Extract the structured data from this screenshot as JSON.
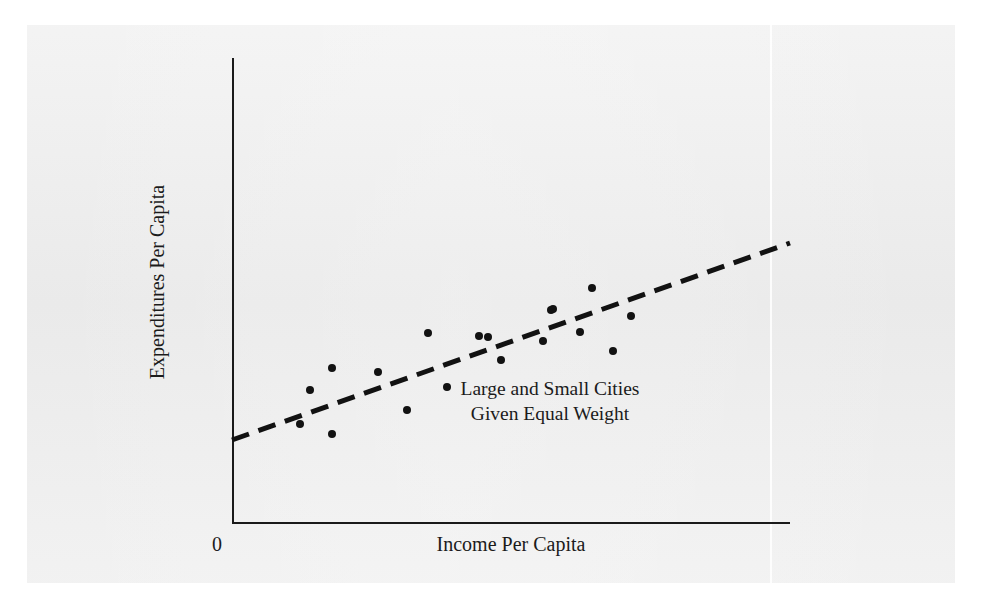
{
  "figure": {
    "paper_color": "#ebebeb",
    "ink_color": "#121212",
    "annotation_line1": "Large and Small Cities",
    "annotation_line2": "Given Equal Weight",
    "origin_label": "0"
  },
  "chart_data": {
    "type": "scatter",
    "title": "",
    "subtitle": "",
    "xlabel": "Income Per Capita",
    "ylabel": "Expenditures Per Capita",
    "xtick_labels": [
      "0"
    ],
    "ytick_labels": [],
    "grid": false,
    "legend": null,
    "annotations": [
      {
        "text": "Large and Small Cities Given Equal Weight",
        "lines": [
          "Large and Small Cities",
          "Given Equal Weight"
        ],
        "x_px": 550,
        "y_px": 400
      }
    ],
    "axis_pixel_frame": {
      "x_axis_x_start_px": 232,
      "x_axis_x_end_px": 790,
      "y_axis_y_top_px": 58,
      "y_axis_y_bottom_px": 523
    },
    "points_px": [
      {
        "x": 300,
        "y": 424
      },
      {
        "x": 310,
        "y": 390
      },
      {
        "x": 332,
        "y": 368
      },
      {
        "x": 332,
        "y": 434
      },
      {
        "x": 378,
        "y": 372
      },
      {
        "x": 407,
        "y": 410
      },
      {
        "x": 428,
        "y": 333
      },
      {
        "x": 447,
        "y": 387
      },
      {
        "x": 479,
        "y": 336
      },
      {
        "x": 488,
        "y": 337
      },
      {
        "x": 501,
        "y": 360
      },
      {
        "x": 543,
        "y": 341
      },
      {
        "x": 551,
        "y": 310
      },
      {
        "x": 553,
        "y": 309
      },
      {
        "x": 580,
        "y": 332
      },
      {
        "x": 592,
        "y": 288
      },
      {
        "x": 613,
        "y": 351
      },
      {
        "x": 631,
        "y": 316
      }
    ],
    "points_normalized": [
      {
        "x": 0.122,
        "y": 0.213
      },
      {
        "x": 0.14,
        "y": 0.286
      },
      {
        "x": 0.179,
        "y": 0.333
      },
      {
        "x": 0.179,
        "y": 0.191
      },
      {
        "x": 0.262,
        "y": 0.325
      },
      {
        "x": 0.313,
        "y": 0.243
      },
      {
        "x": 0.351,
        "y": 0.409
      },
      {
        "x": 0.385,
        "y": 0.292
      },
      {
        "x": 0.443,
        "y": 0.402
      },
      {
        "x": 0.459,
        "y": 0.4
      },
      {
        "x": 0.482,
        "y": 0.351
      },
      {
        "x": 0.557,
        "y": 0.391
      },
      {
        "x": 0.572,
        "y": 0.458
      },
      {
        "x": 0.575,
        "y": 0.46
      },
      {
        "x": 0.624,
        "y": 0.411
      },
      {
        "x": 0.645,
        "y": 0.505
      },
      {
        "x": 0.683,
        "y": 0.37
      },
      {
        "x": 0.715,
        "y": 0.445
      }
    ],
    "trend_line": {
      "style": "dashed",
      "dash_px": 18,
      "gap_px": 10,
      "width_px": 5,
      "x1_px": 232,
      "y1_px": 440,
      "x2_px": 790,
      "y2_px": 243
    }
  }
}
